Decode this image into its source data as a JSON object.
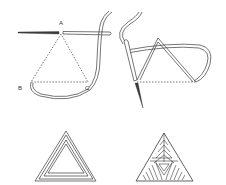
{
  "figure": {
    "labels": {
      "a": "A",
      "b": "B",
      "c": "C"
    },
    "panels": [
      {
        "name": "step-1-needle-at-A",
        "position": "top-left"
      },
      {
        "name": "step-2-needle-through-triangle",
        "position": "top-right"
      },
      {
        "name": "finished-outline-triangle",
        "position": "bottom-left"
      },
      {
        "name": "finished-filled-triangle",
        "position": "bottom-right"
      }
    ],
    "colors": {
      "ink": "#3a3a3a",
      "background": "#ffffff"
    }
  }
}
